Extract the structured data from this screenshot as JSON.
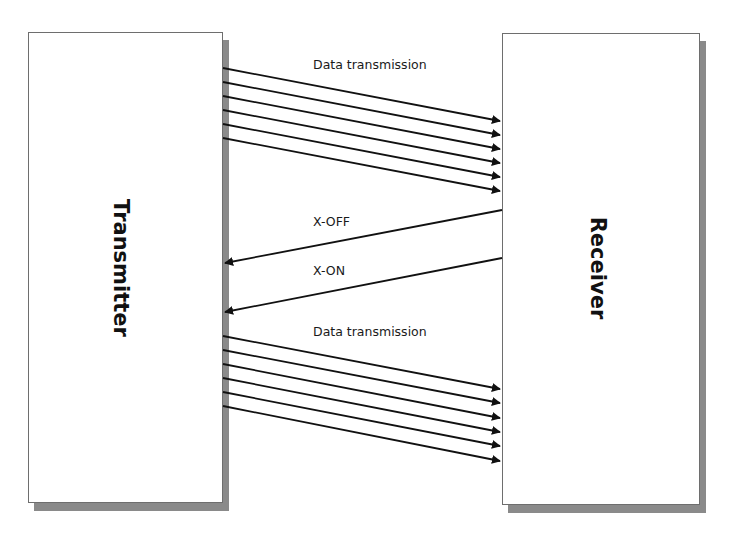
{
  "diagram": {
    "nodes": [
      {
        "id": "transmitter",
        "label": "Transmitter",
        "x": 28,
        "y": 32,
        "w": 195,
        "h": 471
      },
      {
        "id": "receiver",
        "label": "Receiver",
        "x": 502,
        "y": 33,
        "w": 198,
        "h": 472
      }
    ],
    "labels": {
      "data_top": "Data transmission",
      "xoff": "X-OFF",
      "xon": "X-ON",
      "data_bottom": "Data transmission"
    },
    "edges": {
      "data_top": [
        {
          "x1": 223,
          "y1": 68,
          "x2": 500,
          "y2": 121
        },
        {
          "x1": 223,
          "y1": 82,
          "x2": 500,
          "y2": 135
        },
        {
          "x1": 223,
          "y1": 96,
          "x2": 500,
          "y2": 149
        },
        {
          "x1": 223,
          "y1": 110,
          "x2": 500,
          "y2": 163
        },
        {
          "x1": 223,
          "y1": 124,
          "x2": 500,
          "y2": 177
        },
        {
          "x1": 223,
          "y1": 138,
          "x2": 500,
          "y2": 191
        }
      ],
      "control": [
        {
          "name": "xoff",
          "x1": 502,
          "y1": 210,
          "x2": 225,
          "y2": 263
        },
        {
          "name": "xon",
          "x1": 502,
          "y1": 258,
          "x2": 225,
          "y2": 312
        }
      ],
      "data_bottom": [
        {
          "x1": 223,
          "y1": 336,
          "x2": 500,
          "y2": 389
        },
        {
          "x1": 223,
          "y1": 350,
          "x2": 500,
          "y2": 403
        },
        {
          "x1": 223,
          "y1": 364,
          "x2": 500,
          "y2": 418
        },
        {
          "x1": 223,
          "y1": 378,
          "x2": 500,
          "y2": 432
        },
        {
          "x1": 223,
          "y1": 392,
          "x2": 500,
          "y2": 446
        },
        {
          "x1": 223,
          "y1": 406,
          "x2": 500,
          "y2": 461
        }
      ]
    },
    "colors": {
      "line": "#111111",
      "shadow": "#8a8a8a",
      "border": "#6e6e6e"
    }
  }
}
